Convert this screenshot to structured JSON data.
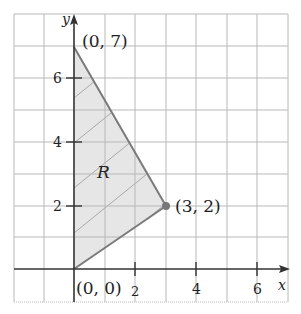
{
  "figure": {
    "region_label": "R",
    "axis_x_label": "x",
    "axis_y_label": "y",
    "x_ticks": [
      {
        "value": 2,
        "label": "2"
      },
      {
        "value": 4,
        "label": "4"
      },
      {
        "value": 6,
        "label": "6"
      }
    ],
    "y_ticks": [
      {
        "value": 2,
        "label": "2"
      },
      {
        "value": 4,
        "label": "4"
      },
      {
        "value": 6,
        "label": "6"
      }
    ],
    "vertices": [
      {
        "x": 0,
        "y": 0,
        "label": "(0, 0)"
      },
      {
        "x": 0,
        "y": 7,
        "label": "(0, 7)"
      },
      {
        "x": 3,
        "y": 2,
        "label": "(3, 2)"
      }
    ],
    "colors": {
      "grid": "#b0b0b0",
      "axis": "#333333",
      "region_fill": "#e6e6e6",
      "boundary": "#7a7a7a",
      "hatch": "#a8a8a8",
      "vertex_dot": "#777777"
    }
  }
}
